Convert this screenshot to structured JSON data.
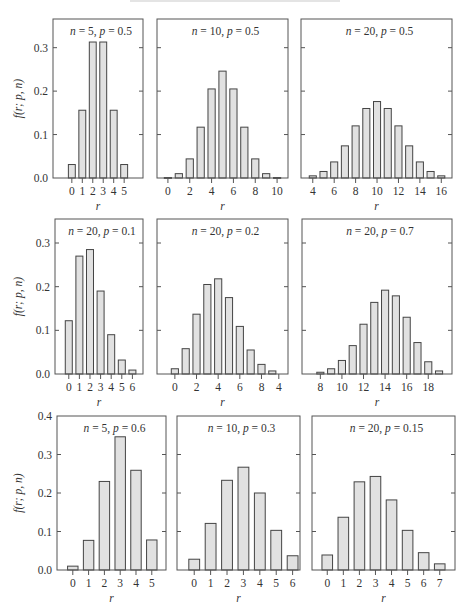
{
  "figure": {
    "ylabel": "f(r; p, n)",
    "xlabel": "r",
    "colors": {
      "bar_fill": "#e1e1e1",
      "bar_edge": "#444444",
      "frame": "#555555",
      "text": "#333333"
    }
  },
  "chart_data": [
    {
      "type": "bar",
      "title": "n = 5, p = 0.5",
      "title_parts": [
        {
          "text": "n",
          "italic": true
        },
        {
          "text": " = 5, "
        },
        {
          "text": "p",
          "italic": true
        },
        {
          "text": " = 0.5"
        }
      ],
      "x": [
        0,
        1,
        2,
        3,
        4,
        5
      ],
      "values": [
        0.031,
        0.156,
        0.313,
        0.313,
        0.156,
        0.031
      ],
      "xlabel": "r",
      "ylabel": "f(r; p, n)",
      "xlim": [
        -1.8,
        6.8
      ],
      "ylim": [
        0,
        0.366
      ],
      "xticks": [
        0,
        1,
        2,
        3,
        4,
        5
      ],
      "xtick_labels": [
        "0",
        "1",
        "2",
        "3",
        "4",
        "5"
      ],
      "yticks": [
        0,
        0.1,
        0.2,
        0.3
      ],
      "ytick_labels": [
        "0.0",
        "0.1",
        "0.2",
        "0.3"
      ],
      "show_ytick_labels": true,
      "grid": false,
      "bar_width": 0.66
    },
    {
      "type": "bar",
      "title": "n = 10, p = 0.5",
      "title_parts": [
        {
          "text": "n",
          "italic": true
        },
        {
          "text": " = 10, "
        },
        {
          "text": "p",
          "italic": true
        },
        {
          "text": " = 0.5"
        }
      ],
      "x": [
        0,
        1,
        2,
        3,
        4,
        5,
        6,
        7,
        8,
        9,
        10
      ],
      "values": [
        0.001,
        0.01,
        0.044,
        0.117,
        0.205,
        0.246,
        0.205,
        0.117,
        0.044,
        0.01,
        0.001
      ],
      "xlabel": "r",
      "ylabel": "",
      "xlim": [
        -1,
        11
      ],
      "ylim": [
        0,
        0.366
      ],
      "xticks": [
        0,
        2,
        4,
        6,
        8,
        10
      ],
      "xtick_labels": [
        "0",
        "2",
        "4",
        "6",
        "8",
        "10"
      ],
      "yticks": [
        0,
        0.1,
        0.2,
        0.3
      ],
      "ytick_labels": [
        "0.0",
        "0.1",
        "0.2",
        "0.3"
      ],
      "show_ytick_labels": false,
      "grid": false,
      "bar_width": 0.66
    },
    {
      "type": "bar",
      "title": "n = 20, p = 0.5",
      "title_parts": [
        {
          "text": "n",
          "italic": true
        },
        {
          "text": " = 20, "
        },
        {
          "text": "p",
          "italic": true
        },
        {
          "text": " = 0.5"
        }
      ],
      "x": [
        4,
        5,
        6,
        7,
        8,
        9,
        10,
        11,
        12,
        13,
        14,
        15,
        16
      ],
      "values": [
        0.005,
        0.015,
        0.037,
        0.074,
        0.12,
        0.16,
        0.176,
        0.16,
        0.12,
        0.074,
        0.037,
        0.015,
        0.005
      ],
      "xlabel": "r",
      "ylabel": "",
      "xlim": [
        2.9,
        17
      ],
      "ylim": [
        0,
        0.366
      ],
      "xticks": [
        4,
        6,
        8,
        10,
        12,
        14,
        16
      ],
      "xtick_labels": [
        "4",
        "6",
        "8",
        "10",
        "12",
        "14",
        "16"
      ],
      "yticks": [
        0,
        0.1,
        0.2,
        0.3
      ],
      "ytick_labels": [
        "0.0",
        "0.1",
        "0.2",
        "0.3"
      ],
      "show_ytick_labels": false,
      "grid": false,
      "bar_width": 0.66
    },
    {
      "type": "bar",
      "title": "n = 20, p = 0.1",
      "title_parts": [
        {
          "text": "n",
          "italic": true
        },
        {
          "text": " = 20, "
        },
        {
          "text": "p",
          "italic": true
        },
        {
          "text": " = 0.1"
        }
      ],
      "x": [
        0,
        1,
        2,
        3,
        4,
        5,
        6
      ],
      "values": [
        0.122,
        0.27,
        0.285,
        0.19,
        0.09,
        0.032,
        0.009
      ],
      "xlabel": "r",
      "ylabel": "f(r; p, n)",
      "xlim": [
        -1.3,
        7
      ],
      "ylim": [
        0,
        0.355
      ],
      "xticks": [
        0,
        1,
        2,
        3,
        4,
        5,
        6
      ],
      "xtick_labels": [
        "0",
        "1",
        "2",
        "3",
        "4",
        "5",
        "6"
      ],
      "yticks": [
        0,
        0.1,
        0.2,
        0.3
      ],
      "ytick_labels": [
        "0.0",
        "0.1",
        "0.2",
        "0.3"
      ],
      "show_ytick_labels": true,
      "grid": false,
      "bar_width": 0.66
    },
    {
      "type": "bar",
      "title": "n = 20, p = 0.2",
      "title_parts": [
        {
          "text": "n",
          "italic": true
        },
        {
          "text": " = 20, "
        },
        {
          "text": "p",
          "italic": true
        },
        {
          "text": " = 0.2"
        }
      ],
      "x": [
        0,
        1,
        2,
        3,
        4,
        5,
        6,
        7,
        8,
        9
      ],
      "values": [
        0.012,
        0.058,
        0.137,
        0.205,
        0.218,
        0.175,
        0.109,
        0.055,
        0.022,
        0.007
      ],
      "xlabel": "r",
      "ylabel": "",
      "xlim": [
        -1.65,
        10.45
      ],
      "ylim": [
        0,
        0.355
      ],
      "xticks": [
        0,
        2,
        4,
        6,
        8,
        9.6
      ],
      "xtick_labels": [
        "0",
        "2",
        "4",
        "6",
        "8",
        "4"
      ],
      "yticks": [
        0,
        0.1,
        0.2,
        0.3
      ],
      "ytick_labels": [
        "0.0",
        "0.1",
        "0.2",
        "0.3"
      ],
      "show_ytick_labels": false,
      "grid": false,
      "bar_width": 0.66
    },
    {
      "type": "bar",
      "title": "n = 20, p = 0.7",
      "title_parts": [
        {
          "text": "n",
          "italic": true
        },
        {
          "text": " = 20, "
        },
        {
          "text": "p",
          "italic": true
        },
        {
          "text": " = 0.7"
        }
      ],
      "x": [
        8,
        9,
        10,
        11,
        12,
        13,
        14,
        15,
        16,
        17,
        18,
        19
      ],
      "values": [
        0.004,
        0.012,
        0.031,
        0.065,
        0.114,
        0.164,
        0.192,
        0.179,
        0.13,
        0.072,
        0.028,
        0.007
      ],
      "xlabel": "r",
      "ylabel": "",
      "xlim": [
        6.3,
        20.2
      ],
      "ylim": [
        0,
        0.355
      ],
      "xticks": [
        8,
        10,
        12,
        14,
        16,
        18
      ],
      "xtick_labels": [
        "8",
        "10",
        "12",
        "14",
        "16",
        "18"
      ],
      "yticks": [
        0,
        0.1,
        0.2,
        0.3
      ],
      "ytick_labels": [
        "0.0",
        "0.1",
        "0.2",
        "0.3"
      ],
      "show_ytick_labels": false,
      "grid": false,
      "bar_width": 0.66
    },
    {
      "type": "bar",
      "title": "n = 5, p = 0.6",
      "title_parts": [
        {
          "text": "n",
          "italic": true
        },
        {
          "text": " = 5, "
        },
        {
          "text": "p",
          "italic": true
        },
        {
          "text": " = 0.6"
        }
      ],
      "x": [
        0,
        1,
        2,
        3,
        4,
        5
      ],
      "values": [
        0.01,
        0.077,
        0.23,
        0.346,
        0.259,
        0.078
      ],
      "xlabel": "r",
      "ylabel": "f(r; p, n)",
      "xlim": [
        -1,
        5.9
      ],
      "ylim": [
        0,
        0.4
      ],
      "xticks": [
        0,
        1,
        2,
        3,
        4,
        5
      ],
      "xtick_labels": [
        "0",
        "1",
        "2",
        "3",
        "4",
        "5"
      ],
      "yticks": [
        0,
        0.1,
        0.2,
        0.3,
        0.4
      ],
      "ytick_labels": [
        "0.0",
        "0.1",
        "0.2",
        "0.3",
        "0.4"
      ],
      "show_ytick_labels": true,
      "grid": false,
      "bar_width": 0.66
    },
    {
      "type": "bar",
      "title": "n = 10, p = 0.3",
      "title_parts": [
        {
          "text": "n",
          "italic": true
        },
        {
          "text": " = 10, "
        },
        {
          "text": "p",
          "italic": true
        },
        {
          "text": " = 0.3"
        }
      ],
      "x": [
        0,
        1,
        2,
        3,
        4,
        5,
        6
      ],
      "values": [
        0.028,
        0.121,
        0.233,
        0.267,
        0.2,
        0.103,
        0.037
      ],
      "xlabel": "r",
      "ylabel": "",
      "xlim": [
        -1.05,
        6.45
      ],
      "ylim": [
        0,
        0.4
      ],
      "xticks": [
        0,
        1,
        2,
        3,
        4,
        5,
        6
      ],
      "xtick_labels": [
        "0",
        "1",
        "2",
        "3",
        "4",
        "5",
        "6"
      ],
      "yticks": [
        0,
        0.1,
        0.2,
        0.3,
        0.4
      ],
      "ytick_labels": [
        "0.0",
        "0.1",
        "0.2",
        "0.3",
        "0.4"
      ],
      "show_ytick_labels": false,
      "grid": false,
      "bar_width": 0.66
    },
    {
      "type": "bar",
      "title": "n = 20, p = 0.15",
      "title_parts": [
        {
          "text": "n",
          "italic": true
        },
        {
          "text": " = 20, "
        },
        {
          "text": "p",
          "italic": true
        },
        {
          "text": " = 0.15"
        }
      ],
      "x": [
        0,
        1,
        2,
        3,
        4,
        5,
        6,
        7
      ],
      "values": [
        0.039,
        0.137,
        0.229,
        0.243,
        0.182,
        0.103,
        0.045,
        0.016
      ],
      "xlabel": "r",
      "ylabel": "",
      "xlim": [
        -0.95,
        7.95
      ],
      "ylim": [
        0,
        0.4
      ],
      "xticks": [
        0,
        1,
        2,
        3,
        4,
        5,
        6,
        7
      ],
      "xtick_labels": [
        "0",
        "1",
        "2",
        "3",
        "4",
        "5",
        "6",
        "7"
      ],
      "yticks": [
        0,
        0.1,
        0.2,
        0.3,
        0.4
      ],
      "ytick_labels": [
        "0.0",
        "0.1",
        "0.2",
        "0.3",
        "0.4"
      ],
      "show_ytick_labels": false,
      "grid": false,
      "bar_width": 0.66
    }
  ]
}
